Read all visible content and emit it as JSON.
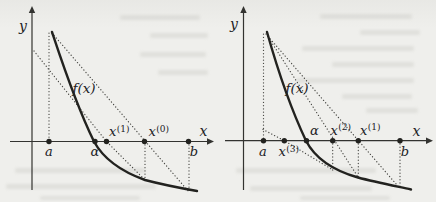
{
  "figure": {
    "ink_color": "#22221f",
    "dotted_color": "#4a4a46",
    "axis_color": "#333330",
    "background_color": "#efefec"
  },
  "chart_data": [
    {
      "id": "left",
      "type": "function-plot",
      "function_label": "f(x)",
      "root_label": "α",
      "axis_point_labels": [
        "a",
        "α",
        "x(1)",
        "x(0)",
        "b"
      ],
      "x_axis": {
        "label": "x",
        "y": 141.5,
        "x1": 10,
        "x2": 208,
        "label_x": 203.5,
        "label_y": 136
      },
      "y_axis": {
        "label": "y",
        "x": 32,
        "y1": 190,
        "y2": 12,
        "label_x": 23,
        "label_y": 31
      },
      "curve": {
        "label": "f(x)",
        "label_x": 84,
        "label_y": 93,
        "path": "M52 32 C62 62 76 105 94 141.5 C103 158 120 171 145 180 C162 184.5 180 188 197 191"
      },
      "construction_lines": [
        {
          "name": "vertical-at-a",
          "points": "49,33 49,141.5"
        },
        {
          "name": "secant-a-b",
          "points": "52,33 189,192"
        },
        {
          "name": "chord-through-x0",
          "points": "34,51 106.5,141.5 145,180"
        },
        {
          "name": "vertical-at-x0",
          "points": "145,141.5 145,180"
        },
        {
          "name": "vertical-at-b",
          "points": "189,141.5 189,191"
        }
      ],
      "points": [
        {
          "name": "a",
          "x": 49,
          "label": "a",
          "sup": "",
          "lx": 49,
          "ly": 156,
          "anchor": "middle"
        },
        {
          "name": "alpha",
          "x": 95,
          "label": "α",
          "sup": "",
          "lx": 95,
          "ly": 155.5,
          "anchor": "middle"
        },
        {
          "name": "x1",
          "x": 106.5,
          "label": "x",
          "sup": "(1)",
          "lx": 109,
          "ly": 136,
          "anchor": "start"
        },
        {
          "name": "x0",
          "x": 144.5,
          "label": "x",
          "sup": "(0)",
          "lx": 148.5,
          "ly": 136,
          "anchor": "start"
        },
        {
          "name": "b",
          "x": 188.5,
          "label": "b",
          "sup": "",
          "lx": 194,
          "ly": 156,
          "anchor": "middle"
        }
      ]
    },
    {
      "id": "right",
      "type": "function-plot",
      "function_label": "f(x)",
      "root_label": "α",
      "axis_point_labels": [
        "a",
        "x(3)",
        "α",
        "x(2)",
        "x(1)",
        "b"
      ],
      "x_axis": {
        "label": "x",
        "y": 140.7,
        "x1": 225,
        "x2": 427,
        "label_x": 416.5,
        "label_y": 136
      },
      "y_axis": {
        "label": "y",
        "x": 243.5,
        "y1": 190,
        "y2": 12,
        "label_x": 234,
        "label_y": 29
      },
      "curve": {
        "label": "f(x)",
        "label_x": 297,
        "label_y": 93,
        "path": "M267 32 C276 64 290 107 306 140.7 C316 160 337 171.5 358 177.5 C375 182 395 186 411 189.5"
      },
      "construction_lines": [
        {
          "name": "vertical-at-a",
          "points": "263.5,34 263.5,140.7"
        },
        {
          "name": "secant-1",
          "points": "266,34 400,188.5"
        },
        {
          "name": "secant-2",
          "points": "267.5,36 358.3,177.5"
        },
        {
          "name": "secant-3",
          "points": "263,129.5 284.3,140.7 333,170"
        },
        {
          "name": "vertical-at-x2",
          "points": "332.7,140.7 332.7,170"
        },
        {
          "name": "vertical-at-x1",
          "points": "358.3,140.7 358.3,177.5"
        },
        {
          "name": "vertical-at-b",
          "points": "400,140.7 400,186.5"
        }
      ],
      "points": [
        {
          "name": "a",
          "x": 263.5,
          "label": "a",
          "sup": "",
          "lx": 263,
          "ly": 155.5,
          "anchor": "middle"
        },
        {
          "name": "x3",
          "x": 284.3,
          "label": "x",
          "sup": "(3)",
          "lx": 278.5,
          "ly": 156,
          "anchor": "start"
        },
        {
          "name": "alpha",
          "x": 306.5,
          "label": "α",
          "sup": "",
          "lx": 314.5,
          "ly": 135,
          "anchor": "middle"
        },
        {
          "name": "x2",
          "x": 332.7,
          "label": "x",
          "sup": "(2)",
          "lx": 330.5,
          "ly": 134.5,
          "anchor": "start"
        },
        {
          "name": "x1",
          "x": 358.3,
          "label": "x",
          "sup": "(1)",
          "lx": 360,
          "ly": 134.5,
          "anchor": "start"
        },
        {
          "name": "b",
          "x": 400,
          "label": "b",
          "sup": "",
          "lx": 405,
          "ly": 155.5,
          "anchor": "middle"
        }
      ]
    }
  ]
}
